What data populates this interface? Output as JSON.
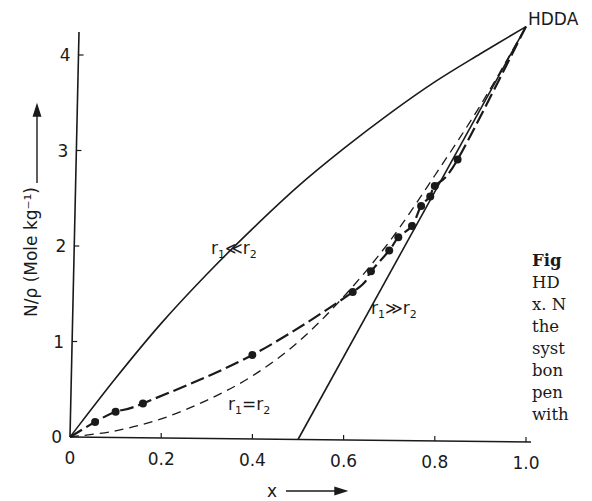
{
  "chart_data": {
    "type": "line",
    "title": "",
    "xlabel": "x",
    "ylabel": "N/ρ (Mole kg⁻¹)",
    "xlim": [
      0,
      1.0
    ],
    "ylim": [
      0,
      4.3
    ],
    "grid": false,
    "x_ticks": [
      "0",
      "0.2",
      "0.4",
      "0.6",
      "0.8",
      "1.0"
    ],
    "y_ticks": [
      "0",
      "1",
      "2",
      "3",
      "4"
    ],
    "end_label": "HDDA",
    "series": [
      {
        "name": "r1<<r2",
        "label": "r₁≪r₂",
        "style": "solid",
        "x": [
          0,
          0.1,
          0.2,
          0.3,
          0.4,
          0.5,
          0.6,
          0.7,
          0.8,
          0.9,
          1.0
        ],
        "y": [
          0,
          0.62,
          1.2,
          1.72,
          2.2,
          2.65,
          3.05,
          3.42,
          3.76,
          4.06,
          4.35
        ]
      },
      {
        "name": "r1>>r2",
        "label": "r₁≫r₂",
        "style": "solid",
        "x": [
          0.5,
          1.0
        ],
        "y": [
          0,
          4.35
        ]
      },
      {
        "name": "r1=r2",
        "label": "r₁=r₂",
        "style": "dashed",
        "x": [
          0,
          0.1,
          0.2,
          0.3,
          0.4,
          0.5,
          0.6,
          0.7,
          0.8,
          0.9,
          1.0
        ],
        "y": [
          0,
          0.07,
          0.2,
          0.4,
          0.66,
          1.02,
          1.5,
          2.08,
          2.78,
          3.52,
          4.35
        ]
      },
      {
        "name": "experimental",
        "label": "",
        "style": "solid-dashed-markers",
        "x": [
          0.055,
          0.1,
          0.16,
          0.4,
          0.62,
          0.66,
          0.7,
          0.72,
          0.75,
          0.77,
          0.79,
          0.8,
          0.85
        ],
        "y": [
          0.16,
          0.27,
          0.36,
          0.88,
          1.55,
          1.77,
          1.99,
          2.13,
          2.25,
          2.46,
          2.56,
          2.67,
          2.95
        ]
      }
    ]
  },
  "caption": {
    "lines": [
      "Fig",
      "HD",
      "x. N",
      "the",
      "syst",
      "bon",
      "pen",
      "with"
    ]
  }
}
